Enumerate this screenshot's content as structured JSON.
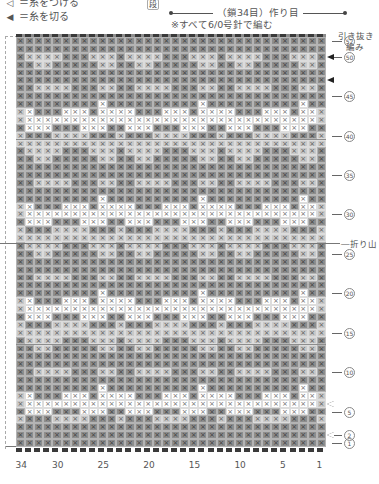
{
  "legend": {
    "items": [
      {
        "symbol": "◁",
        "label": "＝糸をつける"
      },
      {
        "symbol": "◀",
        "label": "＝糸を切る"
      }
    ]
  },
  "header": {
    "dan_label": "段",
    "foundation": "（鎖34目）作り目",
    "note": "※すべて6/0号針で編む"
  },
  "side_note": {
    "line1": "引き抜き",
    "line2": "編み"
  },
  "fold_label": "―折り山",
  "row_labels": [
    {
      "text": "52",
      "row": 52
    },
    {
      "text": "50",
      "row": 50
    },
    {
      "text": "45",
      "row": 45
    },
    {
      "text": "40",
      "row": 40
    },
    {
      "text": "35",
      "row": 35
    },
    {
      "text": "30",
      "row": 30
    },
    {
      "text": "25",
      "row": 25
    },
    {
      "text": "20",
      "row": 20
    },
    {
      "text": "15",
      "row": 15
    },
    {
      "text": "10",
      "row": 10
    },
    {
      "text": "5",
      "row": 5
    },
    {
      "text": "2",
      "row": 2
    },
    {
      "text": "1",
      "row": 1
    }
  ],
  "column_labels": [
    {
      "text": "34",
      "col": 34
    },
    {
      "text": "30",
      "col": 30
    },
    {
      "text": "25",
      "col": 25
    },
    {
      "text": "20",
      "col": 20
    },
    {
      "text": "15",
      "col": 15
    },
    {
      "text": "10",
      "col": 10
    },
    {
      "text": "5",
      "col": 5
    },
    {
      "text": "1",
      "col": 1
    }
  ],
  "markers": [
    {
      "type": "cut",
      "row": 50
    },
    {
      "type": "cut",
      "row": 47
    },
    {
      "type": "join",
      "row": 6
    },
    {
      "type": "join",
      "row": 2
    }
  ],
  "grid": {
    "columns": 34,
    "rows": 52,
    "stitch_symbol": "×",
    "colors": {
      "d": "#8d8d8d",
      "l": "#c9c9c9",
      "w": "#ffffff"
    },
    "motif_width": 11,
    "motif": [
      "ddddddddddd",
      "ddddddddddd",
      "ddlldddddll",
      "dlllldddlll",
      "lllllllllll",
      "ldddllllddd",
      "dwwwdddwwwd",
      "wwwwwwwwwww",
      "wwdddwwwdww",
      "dddddddddwd",
      "ddddddddddd",
      "ddlllldddll"
    ]
  }
}
